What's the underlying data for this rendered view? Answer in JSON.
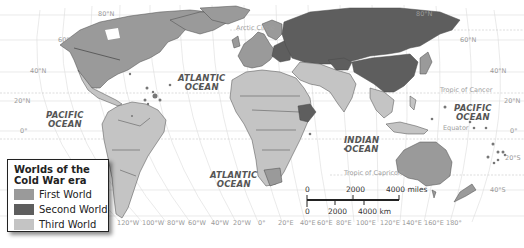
{
  "legend": {
    "title_line1": "Worlds of the",
    "title_line2": "Cold War era",
    "items": [
      {
        "label": "First World",
        "color": "#9a9a9a"
      },
      {
        "label": "Second World",
        "color": "#5e5e5e"
      },
      {
        "label": "Third World",
        "color": "#c4c4c4"
      }
    ]
  },
  "oceans": {
    "pacific_west": [
      "PACIFIC",
      "OCEAN"
    ],
    "pacific_east": [
      "PACIFIC",
      "OCEAN"
    ],
    "atlantic_north": [
      "ATLANTIC",
      "OCEAN"
    ],
    "atlantic_south": [
      "ATLANTIC",
      "OCEAN"
    ],
    "indian": [
      "INDIAN",
      "OCEAN"
    ]
  },
  "special_lines": {
    "arctic_circle": "Arctic Circle",
    "tropic_cancer": "Tropic of Cancer",
    "equator": "Equator",
    "tropic_capricorn": "Tropic of Capricorn"
  },
  "latitude_labels_left": [
    "80°N",
    "60°N",
    "40°N",
    "20°N",
    "0°"
  ],
  "latitude_labels_right": [
    "80°N",
    "60°N",
    "40°N",
    "20°N",
    "0°",
    "20°S",
    "40°S"
  ],
  "longitude_labels": [
    "120°W",
    "100°W",
    "80°W",
    "60°W",
    "40°W",
    "20°W",
    "0°",
    "20°E",
    "40°E",
    "60°E",
    "80°E",
    "100°E",
    "120°E",
    "140°E",
    "160°E",
    "180°"
  ],
  "scale_bar": {
    "miles_ticks": [
      "0",
      "2000",
      "4000 miles"
    ],
    "km_ticks": [
      "0",
      "2000",
      "4000 km"
    ]
  },
  "colors": {
    "first_world": "#9a9a9a",
    "second_world": "#5e5e5e",
    "third_world": "#c4c4c4",
    "ocean": "#ffffff",
    "graticule": "#d8d8d8",
    "border": "#3a3a3a"
  }
}
